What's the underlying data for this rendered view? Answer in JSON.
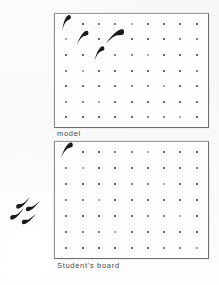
{
  "scene": {
    "title_text_visible": false,
    "background_color": "#fbfbfc",
    "ink_color": "#1a1a1a",
    "border_color": "#7d7d7d",
    "peg_color": "#3a3a3a"
  },
  "boards": [
    {
      "id": "model",
      "caption": "model",
      "grid": {
        "columns": 9,
        "rows": 7
      },
      "pieces": [
        {
          "name": "pennant",
          "col": 1,
          "row": 1,
          "rotation": -8,
          "scale": 1.0
        },
        {
          "name": "pennant",
          "col": 2,
          "row": 2,
          "rotation": 4,
          "scale": 1.05
        },
        {
          "name": "pennant",
          "col": 4,
          "row": 2,
          "rotation": 18,
          "scale": 1.35
        },
        {
          "name": "pennant",
          "col": 3,
          "row": 3,
          "rotation": -2,
          "scale": 1.0
        }
      ],
      "occupied_count": 4,
      "empty_count": 59
    },
    {
      "id": "student",
      "caption": "Student's board",
      "grid": {
        "columns": 9,
        "rows": 7
      },
      "pieces": [
        {
          "name": "pennant",
          "col": 1,
          "row": 1,
          "rotation": 2,
          "scale": 1.1
        }
      ],
      "occupied_count": 1,
      "empty_count": 62
    }
  ],
  "loose_pieces": {
    "name": "spare-pennant-pile",
    "count": 3,
    "items": [
      {
        "name": "pennant",
        "x": 8,
        "y": 1,
        "rotation": 196,
        "scale": 1.0
      },
      {
        "name": "pennant",
        "x": 18,
        "y": 4,
        "rotation": 200,
        "scale": 1.0
      },
      {
        "name": "pennant",
        "x": 2,
        "y": 12,
        "rotation": 196,
        "scale": 1.0
      },
      {
        "name": "pennant",
        "x": 14,
        "y": 17,
        "rotation": 200,
        "scale": 1.0
      }
    ]
  },
  "icons": {
    "pennant": "pennant-icon",
    "peg": "peg-icon"
  }
}
